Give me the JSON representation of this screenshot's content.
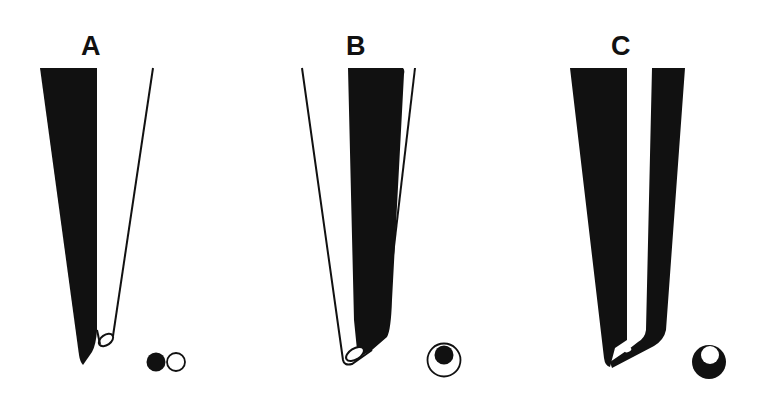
{
  "figure": {
    "panels": [
      {
        "id": "A",
        "label": "A",
        "legend": "filled-circle-beside-open-circle"
      },
      {
        "id": "B",
        "label": "B",
        "legend": "filled-circle-inside-open-circle"
      },
      {
        "id": "C",
        "label": "C",
        "legend": "open-circle-inside-filled-circle"
      }
    ]
  },
  "colors": {
    "ink": "#111111",
    "background": "#ffffff"
  }
}
